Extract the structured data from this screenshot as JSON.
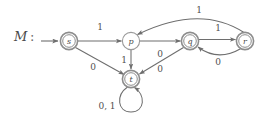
{
  "diagram": {
    "title_label": "M",
    "title_separator": ":",
    "type": "finite-state-automaton",
    "width": 272,
    "height": 117,
    "stroke_color": "#6e6e6e",
    "accent_color": "#555555",
    "text_color": "#4a4a4a",
    "background_color": "#ffffff"
  },
  "states": [
    {
      "id": "s",
      "label": "s",
      "x": 69,
      "y": 41,
      "radius": 8.5,
      "accepting": true,
      "start": true
    },
    {
      "id": "p",
      "label": "p",
      "x": 131,
      "y": 41,
      "radius": 8.5,
      "accepting": false,
      "start": false
    },
    {
      "id": "q",
      "label": "q",
      "x": 190,
      "y": 41,
      "radius": 8.5,
      "accepting": true,
      "start": false
    },
    {
      "id": "r",
      "label": "r",
      "x": 245,
      "y": 41,
      "radius": 8.5,
      "accepting": true,
      "start": false
    },
    {
      "id": "t",
      "label": "t",
      "x": 131,
      "y": 79,
      "radius": 8.5,
      "accepting": true,
      "start": false
    }
  ],
  "transitions": [
    {
      "id": "s-p",
      "from": "s",
      "to": "p",
      "symbol": "1",
      "label_x": 100,
      "label_y": 27
    },
    {
      "id": "s-t",
      "from": "s",
      "to": "t",
      "symbol": "0",
      "label_x": 93,
      "label_y": 67
    },
    {
      "id": "p-q",
      "from": "p",
      "to": "q",
      "symbol": "0",
      "label_x": 160,
      "label_y": 54
    },
    {
      "id": "p-t",
      "from": "p",
      "to": "t",
      "symbol": "1",
      "label_x": 124,
      "label_y": 60
    },
    {
      "id": "q-r",
      "from": "q",
      "to": "r",
      "symbol": "1",
      "label_x": 218,
      "label_y": 28
    },
    {
      "id": "q-t",
      "from": "q",
      "to": "t",
      "symbol": "0",
      "label_x": 160,
      "label_y": 69
    },
    {
      "id": "r-q",
      "from": "r",
      "to": "q",
      "symbol": "0",
      "label_x": 218,
      "label_y": 62
    },
    {
      "id": "r-p",
      "from": "r",
      "to": "p",
      "symbol": "1",
      "label_x": 199,
      "label_y": 10
    },
    {
      "id": "t-t",
      "from": "t",
      "to": "t",
      "symbol": "0, 1",
      "label_x": 107,
      "label_y": 106
    }
  ],
  "start_marker": {
    "id": "start-arrow",
    "from_x": 41,
    "to_x": 59,
    "y": 41
  }
}
